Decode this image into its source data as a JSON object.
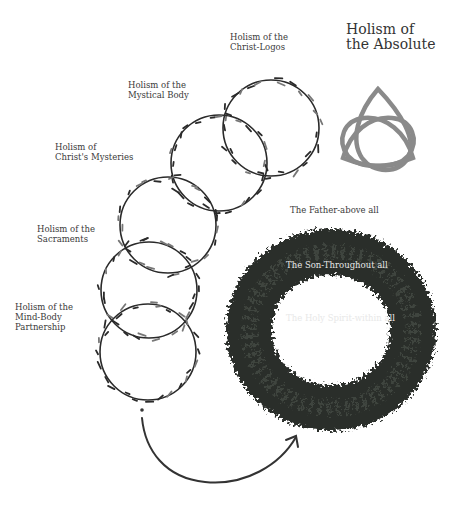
{
  "title": "Holism of\nthe Absolute",
  "levels": [
    {
      "label": "Holism of the\nChrist-Logos"
    },
    {
      "label": "Holism of the\nMystical Body"
    },
    {
      "label": "Holism of\nChrist's Mysteries"
    },
    {
      "label": "Holism of the\nSacraments"
    },
    {
      "label": "Holism of the\nMind-Body\nPartnership"
    }
  ],
  "wreath": {
    "labels": [
      "The Father-above all",
      "The Son-Throughout all",
      "The Holy Spirit-within all"
    ]
  },
  "symbol": {
    "name": "triquetra",
    "color": "#8a8a8a"
  },
  "colors": {
    "vine": "#2a2a2a",
    "wreath": "#2b2e2b",
    "arrow": "#333333"
  }
}
